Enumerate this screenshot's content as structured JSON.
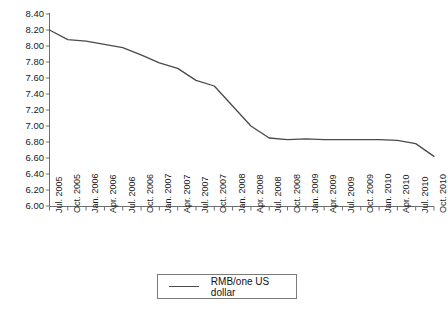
{
  "chart_data": {
    "type": "line",
    "title": "",
    "xlabel": "",
    "ylabel": "",
    "ylim": [
      6.0,
      8.4
    ],
    "ytick_step": 0.2,
    "grid": false,
    "legend_position": "bottom-center",
    "categories": [
      "Jul. 2005",
      "Oct. 2005",
      "Jan. 2006",
      "Apr. 2006",
      "Jul. 2006",
      "Oct. 2006",
      "Jan. 2007",
      "Apr. 2007",
      "Jul. 2007",
      "Oct. 2007",
      "Jan. 2008",
      "Apr. 2008",
      "Jul. 2008",
      "Oct. 2008",
      "Jan. 2009",
      "Apr. 2009",
      "Jul. 2009",
      "Oct. 2009",
      "Jan. 2010",
      "Apr. 2010",
      "Jul. 2010",
      "Oct. 2010"
    ],
    "series": [
      {
        "name": "RMB/one US dollar",
        "color": "#4a4a4a",
        "values": [
          8.2,
          8.08,
          8.06,
          8.02,
          7.98,
          7.89,
          7.79,
          7.72,
          7.57,
          7.5,
          7.25,
          7.0,
          6.85,
          6.83,
          6.84,
          6.83,
          6.83,
          6.83,
          6.83,
          6.82,
          6.78,
          6.62
        ]
      }
    ],
    "ytick_labels": [
      "8.40",
      "8.20",
      "8.00",
      "7.80",
      "7.60",
      "7.40",
      "7.20",
      "7.00",
      "6.80",
      "6.60",
      "6.40",
      "6.20",
      "6.00"
    ]
  },
  "legend": {
    "entries": [
      {
        "label": "RMB/one US dollar",
        "marker": "line",
        "color": "#4a4a4a"
      }
    ]
  },
  "axis": {
    "y_axis_name": "y-axis",
    "x_axis_name": "x-axis"
  }
}
